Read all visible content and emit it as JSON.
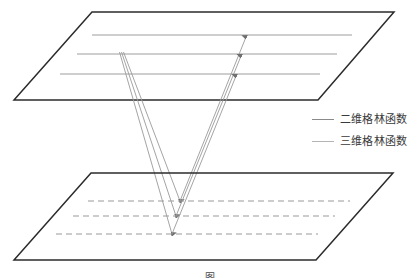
{
  "figure": {
    "title_caption": "图",
    "background": "#ffffff",
    "colors": {
      "plane_edge": "#2b2b2b",
      "line_2d": "#8a8a8a",
      "line_3d": "#b4b4b4",
      "dashed_line": "#9a9a9a",
      "ray": "#8f8f8f"
    }
  },
  "upper_plane": {
    "name": "upper-plane",
    "vertices": [
      [
        92,
        12
      ],
      [
        394,
        12
      ],
      [
        318,
        100
      ],
      [
        14,
        100
      ]
    ],
    "solid_lines": [
      {
        "label": "upper-line-1",
        "x1": 92,
        "y1": 35,
        "x2": 352,
        "y2": 35
      },
      {
        "label": "upper-line-2",
        "x1": 77,
        "y1": 54,
        "x2": 337,
        "y2": 54
      },
      {
        "label": "upper-line-3",
        "x1": 60,
        "y1": 74,
        "x2": 320,
        "y2": 74
      }
    ]
  },
  "lower_plane": {
    "name": "lower-plane",
    "vertices": [
      [
        91,
        173
      ],
      [
        393,
        173
      ],
      [
        316,
        260
      ],
      [
        14,
        260
      ]
    ],
    "dashed_lines": [
      {
        "label": "lower-dashed-1",
        "x1": 88,
        "y1": 201,
        "x2": 350,
        "y2": 201
      },
      {
        "label": "lower-dashed-2",
        "x1": 73,
        "y1": 216,
        "x2": 335,
        "y2": 216
      },
      {
        "label": "lower-dashed-3",
        "x1": 56,
        "y1": 234,
        "x2": 318,
        "y2": 234
      }
    ]
  },
  "rays": {
    "description": "V-shaped ray paths from upper plane converging on lower plane",
    "paths": [
      {
        "label": "ray-v-1",
        "down": [
          [
            123,
            54
          ],
          [
            180,
            201
          ]
        ],
        "up": [
          [
            180,
            201
          ],
          [
            246,
            35
          ]
        ]
      },
      {
        "label": "ray-v-2",
        "down": [
          [
            121,
            54
          ],
          [
            176,
            216
          ]
        ],
        "up": [
          [
            176,
            216
          ],
          [
            241,
            54
          ]
        ]
      },
      {
        "label": "ray-v-3",
        "down": [
          [
            119,
            54
          ],
          [
            172,
            234
          ]
        ],
        "up": [
          [
            172,
            234
          ],
          [
            236,
            74
          ]
        ]
      }
    ],
    "arrowheads": [
      {
        "label": "arrowhead-upper-1",
        "x": 246,
        "y": 35
      },
      {
        "label": "arrowhead-upper-2",
        "x": 241,
        "y": 54
      },
      {
        "label": "arrowhead-upper-3",
        "x": 236,
        "y": 74
      },
      {
        "label": "arrowhead-lower-1",
        "x": 180,
        "y": 201
      },
      {
        "label": "arrowhead-lower-2",
        "x": 176,
        "y": 216
      },
      {
        "label": "arrowhead-lower-3",
        "x": 172,
        "y": 234
      }
    ]
  },
  "legend": {
    "items": [
      {
        "label": "二维格林函数",
        "style": "solid-dark"
      },
      {
        "label": "三维格林函数",
        "style": "solid-light"
      }
    ]
  },
  "caption": {
    "text": "图"
  }
}
